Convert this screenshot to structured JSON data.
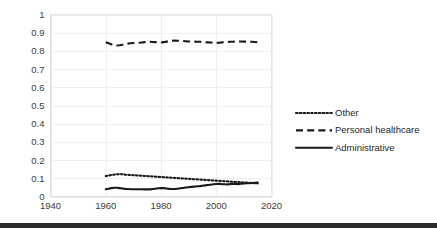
{
  "chart_data": {
    "type": "line",
    "title": "",
    "subtitle": "",
    "xlabel": "",
    "ylabel": "",
    "xlim": [
      1940,
      2020
    ],
    "ylim": [
      0,
      1
    ],
    "grid": true,
    "legend_position": "right",
    "x_ticks": [
      "1940",
      "1960",
      "1980",
      "2000",
      "2020"
    ],
    "y_ticks": [
      "0",
      "0.1",
      "0.2",
      "0.3",
      "0.4",
      "0.5",
      "0.6",
      "0.7",
      "0.8",
      "0.9",
      "1"
    ],
    "x": [
      1960,
      1961,
      1962,
      1963,
      1964,
      1965,
      1966,
      1967,
      1968,
      1969,
      1970,
      1971,
      1972,
      1973,
      1974,
      1975,
      1976,
      1977,
      1978,
      1979,
      1980,
      1981,
      1982,
      1983,
      1984,
      1985,
      1986,
      1987,
      1988,
      1989,
      1990,
      1991,
      1992,
      1993,
      1994,
      1995,
      1996,
      1997,
      1998,
      1999,
      2000,
      2001,
      2002,
      2003,
      2004,
      2005,
      2006,
      2007,
      2008,
      2009,
      2010,
      2011,
      2012,
      2013,
      2014,
      2015
    ],
    "series": [
      {
        "name": "Other",
        "style": "dotted",
        "color": "#1a1a1a",
        "values": [
          0.112,
          0.115,
          0.118,
          0.12,
          0.122,
          0.123,
          0.122,
          0.12,
          0.119,
          0.118,
          0.117,
          0.116,
          0.115,
          0.114,
          0.113,
          0.112,
          0.111,
          0.11,
          0.109,
          0.108,
          0.107,
          0.106,
          0.105,
          0.104,
          0.103,
          0.102,
          0.101,
          0.1,
          0.099,
          0.098,
          0.097,
          0.096,
          0.095,
          0.094,
          0.093,
          0.092,
          0.091,
          0.09,
          0.089,
          0.088,
          0.087,
          0.086,
          0.085,
          0.084,
          0.083,
          0.082,
          0.081,
          0.08,
          0.079,
          0.078,
          0.077,
          0.076,
          0.075,
          0.074,
          0.073,
          0.072
        ]
      },
      {
        "name": "Personal healthcare",
        "style": "dashed",
        "color": "#1a1a1a",
        "values": [
          0.848,
          0.842,
          0.836,
          0.832,
          0.83,
          0.831,
          0.834,
          0.838,
          0.84,
          0.842,
          0.843,
          0.844,
          0.845,
          0.846,
          0.848,
          0.849,
          0.85,
          0.849,
          0.848,
          0.847,
          0.846,
          0.848,
          0.851,
          0.854,
          0.856,
          0.857,
          0.856,
          0.855,
          0.854,
          0.853,
          0.852,
          0.851,
          0.851,
          0.85,
          0.85,
          0.849,
          0.848,
          0.847,
          0.846,
          0.845,
          0.844,
          0.845,
          0.847,
          0.848,
          0.849,
          0.85,
          0.85,
          0.851,
          0.851,
          0.852,
          0.851,
          0.851,
          0.85,
          0.85,
          0.849,
          0.848
        ]
      },
      {
        "name": "Administrative",
        "style": "solid",
        "color": "#1a1a1a",
        "values": [
          0.04,
          0.043,
          0.046,
          0.048,
          0.048,
          0.046,
          0.044,
          0.042,
          0.041,
          0.04,
          0.04,
          0.04,
          0.04,
          0.04,
          0.039,
          0.039,
          0.039,
          0.041,
          0.043,
          0.045,
          0.047,
          0.046,
          0.044,
          0.042,
          0.041,
          0.041,
          0.043,
          0.045,
          0.047,
          0.049,
          0.051,
          0.053,
          0.054,
          0.056,
          0.057,
          0.059,
          0.061,
          0.063,
          0.065,
          0.067,
          0.069,
          0.07,
          0.068,
          0.067,
          0.066,
          0.068,
          0.07,
          0.069,
          0.068,
          0.07,
          0.072,
          0.073,
          0.073,
          0.074,
          0.075,
          0.076
        ]
      }
    ]
  },
  "legend": {
    "items": [
      {
        "label": "Other",
        "style": "dotted"
      },
      {
        "label": "Personal healthcare",
        "style": "dashed"
      },
      {
        "label": "Administrative",
        "style": "solid"
      }
    ]
  }
}
